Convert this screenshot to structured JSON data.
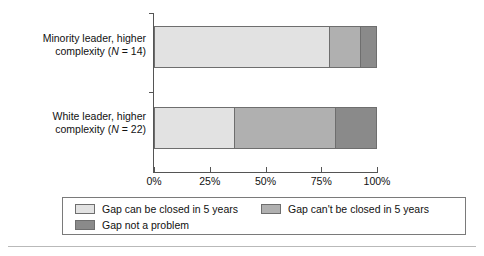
{
  "chart_data": {
    "type": "bar",
    "orientation": "horizontal",
    "stacked": true,
    "normalized_percent": true,
    "title": "",
    "subtitle": "",
    "xlabel": "",
    "ylabel": "",
    "xlim": [
      0,
      100
    ],
    "grid": false,
    "legend_position": "bottom",
    "categories": [
      "Minority leader, higher complexity (N = 14)",
      "White leader, higher complexity (N = 22)"
    ],
    "series": [
      {
        "name": "Gap can be closed in 5 years",
        "color": "#e2e2e2",
        "values": [
          78.5,
          36.0
        ]
      },
      {
        "name": "Gap can't be closed in 5 years",
        "color": "#b0b0b0",
        "values": [
          14.0,
          45.0
        ]
      },
      {
        "name": "Gap not a problem",
        "color": "#8a8a8a",
        "values": [
          7.5,
          19.0
        ]
      }
    ],
    "xticks": [
      0,
      25,
      50,
      75,
      100
    ],
    "xticklabels": [
      "0%",
      "25%",
      "50%",
      "75%",
      "100%"
    ]
  },
  "axis": {
    "xticklabels": [
      "0%",
      "25%",
      "50%",
      "75%",
      "100%"
    ]
  },
  "categories": [
    {
      "line1": "Minority leader, higher",
      "line2_pre": "complexity (",
      "line2_ital": "N",
      "line2_post": " = 14)"
    },
    {
      "line1": "White leader, higher",
      "line2_pre": "complexity (",
      "line2_ital": "N",
      "line2_post": " = 22)"
    }
  ],
  "legend": {
    "items": [
      {
        "label": "Gap can be closed in 5 years",
        "color": "#e2e2e2"
      },
      {
        "label": "Gap can't be closed in 5 years",
        "color": "#b0b0b0"
      },
      {
        "label": "Gap not a problem",
        "color": "#8a8a8a"
      }
    ]
  },
  "colors": {
    "light": "#e2e2e2",
    "medium": "#b0b0b0",
    "dark": "#8a8a8a",
    "outline": "#6e6e6e",
    "axis": "#555555",
    "rule": "#b9b9b9"
  }
}
